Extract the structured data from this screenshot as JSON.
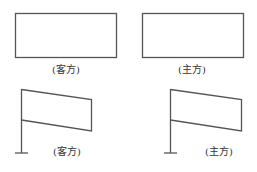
{
  "diagram": {
    "stroke_color": "#555555",
    "text_color": "#333333",
    "panels": [
      {
        "id": "top-left",
        "shape": "rectangle",
        "label": "(客方)"
      },
      {
        "id": "top-right",
        "shape": "rectangle",
        "label": "(主方)"
      },
      {
        "id": "bottom-left",
        "shape": "flag-on-pole",
        "label": "(客方)"
      },
      {
        "id": "bottom-right",
        "shape": "flag-on-pole",
        "label": "(主方)"
      }
    ]
  }
}
